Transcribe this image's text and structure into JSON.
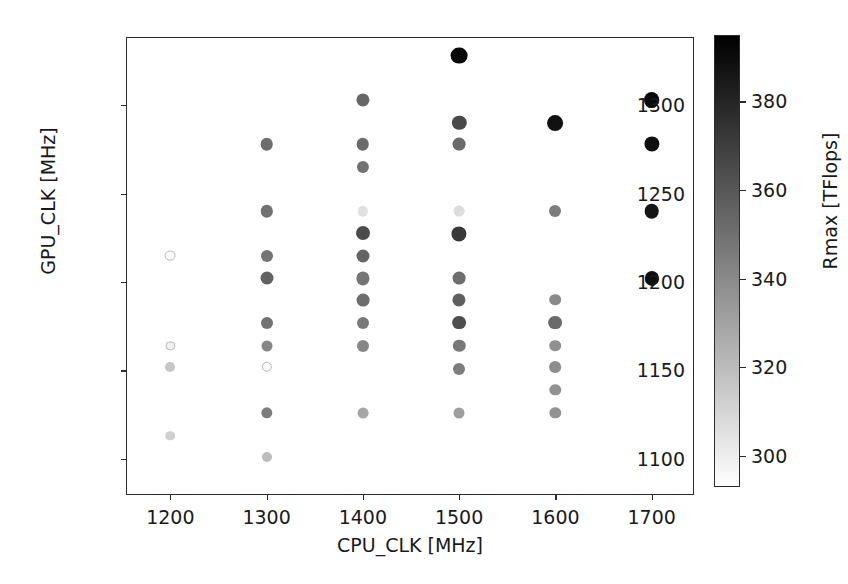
{
  "chart_data": {
    "type": "scatter",
    "title": "",
    "xlabel": "CPU_CLK [MHz]",
    "ylabel": "GPU_CLK [MHz]",
    "xlim": [
      1155,
      1745
    ],
    "ylim": [
      1079,
      1338
    ],
    "xticks": [
      1200,
      1300,
      1400,
      1500,
      1600,
      1700
    ],
    "yticks": [
      1100,
      1150,
      1200,
      1250,
      1300
    ],
    "xtick_labels": [
      "1200",
      "1300",
      "1400",
      "1500",
      "1600",
      "1700"
    ],
    "ytick_labels": [
      "1100",
      "1150",
      "1200",
      "1250",
      "1300"
    ],
    "grid": false,
    "legend": null,
    "colorbar": {
      "label": "Rmax [TFlops]",
      "ticks": [
        300,
        320,
        340,
        360,
        380
      ],
      "tick_labels": [
        "300",
        "320",
        "340",
        "360",
        "380"
      ],
      "vmin": 293,
      "vmax": 395,
      "colormap": "gray_reversed",
      "low_color": "#ffffff",
      "high_color": "#000000",
      "position": "right"
    },
    "color_variable": "Rmax [TFlops]",
    "size_variable": "Rmax [TFlops]",
    "points": [
      {
        "x": 1200,
        "y": 1215,
        "c": 295,
        "r": 5.4
      },
      {
        "x": 1200,
        "y": 1164,
        "c": 299,
        "r": 4.6
      },
      {
        "x": 1200,
        "y": 1152,
        "c": 316,
        "r": 5.0
      },
      {
        "x": 1200,
        "y": 1113,
        "c": 312,
        "r": 4.8
      },
      {
        "x": 1300,
        "y": 1278,
        "c": 351,
        "r": 6.3
      },
      {
        "x": 1300,
        "y": 1240,
        "c": 350,
        "r": 6.2
      },
      {
        "x": 1300,
        "y": 1215,
        "c": 349,
        "r": 6.0
      },
      {
        "x": 1300,
        "y": 1202,
        "c": 356,
        "r": 6.5
      },
      {
        "x": 1300,
        "y": 1177,
        "c": 349,
        "r": 6.0
      },
      {
        "x": 1300,
        "y": 1164,
        "c": 341,
        "r": 5.5
      },
      {
        "x": 1300,
        "y": 1152,
        "c": 296,
        "r": 5.2
      },
      {
        "x": 1300,
        "y": 1126,
        "c": 345,
        "r": 5.7
      },
      {
        "x": 1300,
        "y": 1101,
        "c": 320,
        "r": 5.0
      },
      {
        "x": 1400,
        "y": 1303,
        "c": 354,
        "r": 6.6
      },
      {
        "x": 1400,
        "y": 1278,
        "c": 352,
        "r": 6.3
      },
      {
        "x": 1400,
        "y": 1265,
        "c": 350,
        "r": 6.1
      },
      {
        "x": 1400,
        "y": 1240,
        "c": 305,
        "r": 5.2
      },
      {
        "x": 1400,
        "y": 1228,
        "c": 365,
        "r": 7.0
      },
      {
        "x": 1400,
        "y": 1215,
        "c": 355,
        "r": 6.5
      },
      {
        "x": 1400,
        "y": 1202,
        "c": 348,
        "r": 6.6
      },
      {
        "x": 1400,
        "y": 1190,
        "c": 351,
        "r": 6.4
      },
      {
        "x": 1400,
        "y": 1177,
        "c": 347,
        "r": 6.0
      },
      {
        "x": 1400,
        "y": 1164,
        "c": 341,
        "r": 6.0
      },
      {
        "x": 1400,
        "y": 1126,
        "c": 329,
        "r": 5.4
      },
      {
        "x": 1500,
        "y": 1328,
        "c": 392,
        "r": 8.4
      },
      {
        "x": 1500,
        "y": 1290,
        "c": 366,
        "r": 7.2
      },
      {
        "x": 1500,
        "y": 1278,
        "c": 352,
        "r": 6.4
      },
      {
        "x": 1500,
        "y": 1240,
        "c": 307,
        "r": 5.4
      },
      {
        "x": 1500,
        "y": 1227,
        "c": 372,
        "r": 7.6
      },
      {
        "x": 1500,
        "y": 1202,
        "c": 351,
        "r": 6.4
      },
      {
        "x": 1500,
        "y": 1190,
        "c": 357,
        "r": 6.6
      },
      {
        "x": 1500,
        "y": 1177,
        "c": 364,
        "r": 6.9
      },
      {
        "x": 1500,
        "y": 1164,
        "c": 347,
        "r": 6.2
      },
      {
        "x": 1500,
        "y": 1151,
        "c": 345,
        "r": 6.0
      },
      {
        "x": 1500,
        "y": 1126,
        "c": 332,
        "r": 5.5
      },
      {
        "x": 1600,
        "y": 1290,
        "c": 388,
        "r": 7.9
      },
      {
        "x": 1600,
        "y": 1240,
        "c": 345,
        "r": 6.0
      },
      {
        "x": 1600,
        "y": 1190,
        "c": 340,
        "r": 5.8
      },
      {
        "x": 1600,
        "y": 1177,
        "c": 352,
        "r": 6.9
      },
      {
        "x": 1600,
        "y": 1164,
        "c": 338,
        "r": 5.8
      },
      {
        "x": 1600,
        "y": 1152,
        "c": 339,
        "r": 5.9
      },
      {
        "x": 1600,
        "y": 1139,
        "c": 337,
        "r": 5.7
      },
      {
        "x": 1600,
        "y": 1126,
        "c": 336,
        "r": 5.7
      },
      {
        "x": 1700,
        "y": 1303,
        "c": 391,
        "r": 7.9
      },
      {
        "x": 1700,
        "y": 1278,
        "c": 389,
        "r": 7.6
      },
      {
        "x": 1700,
        "y": 1240,
        "c": 387,
        "r": 7.3
      },
      {
        "x": 1700,
        "y": 1202,
        "c": 390,
        "r": 7.1
      }
    ]
  }
}
